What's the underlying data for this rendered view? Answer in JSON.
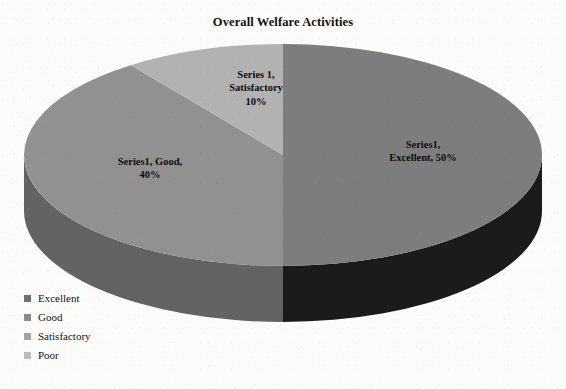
{
  "chart_data": {
    "type": "pie",
    "title": "Overall Welfare Activities",
    "three_d": true,
    "categories": [
      "Excellent",
      "Good",
      "Satisfactory",
      "Poor"
    ],
    "values": [
      50,
      40,
      10,
      0
    ],
    "value_unit": "%",
    "series_name": "Series1",
    "legend_position": "bottom-left",
    "grid": false,
    "slices": [
      {
        "name": "Excellent",
        "value": 50,
        "label": "Series1,\nExcellent, 50%",
        "top_color": "#7d7d7d",
        "side_color": "#1b1b1b",
        "start_angle_deg": 0,
        "end_angle_deg": 180
      },
      {
        "name": "Good",
        "value": 40,
        "label": "Series1, Good,\n40%",
        "top_color": "#919191",
        "side_color": "#636363",
        "start_angle_deg": 180,
        "end_angle_deg": 324
      },
      {
        "name": "Satisfactory",
        "value": 10,
        "label": "Series 1,\nSatisfactory\n10%",
        "top_color": "#b2b2b2",
        "side_color": "#8c8c8c",
        "start_angle_deg": 324,
        "end_angle_deg": 360
      },
      {
        "name": "Poor",
        "value": 0,
        "label": "",
        "top_color": "#c4c4c4",
        "side_color": "#9e9e9e",
        "start_angle_deg": 360,
        "end_angle_deg": 360
      }
    ]
  },
  "title": {
    "text": "Overall Welfare Activities"
  },
  "labels": {
    "excellent": "Series1,\nExcellent, 50%",
    "good": "Series1, Good,\n40%",
    "satisfactory": "Series 1,\nSatisfactory\n10%"
  },
  "legend": {
    "items": [
      {
        "label": "Excellent",
        "color": "#6f6f6f"
      },
      {
        "label": "Good",
        "color": "#8a8a8a"
      },
      {
        "label": "Satisfactory",
        "color": "#a3a3a3"
      },
      {
        "label": "Poor",
        "color": "#bcbcbc"
      }
    ]
  }
}
